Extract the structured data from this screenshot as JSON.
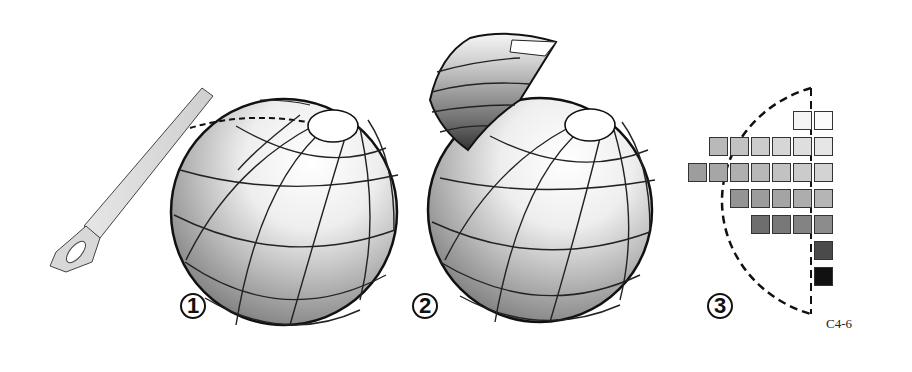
{
  "figure": {
    "caption_code": "C4-6",
    "panels": [
      {
        "number": "1",
        "label": "Sphere with saw cutting cap"
      },
      {
        "number": "2",
        "label": "Sphere with cut-away segment"
      },
      {
        "number": "3",
        "label": "Cross-section value grid"
      }
    ]
  },
  "grid": {
    "cells": [
      {
        "col": 5,
        "row": 0,
        "color": "#f4f4f4"
      },
      {
        "col": 6,
        "row": 0,
        "color": "#fbfbfb"
      },
      {
        "col": 1,
        "row": 1,
        "color": "#b9b9b9"
      },
      {
        "col": 2,
        "row": 1,
        "color": "#c2c2c2"
      },
      {
        "col": 3,
        "row": 1,
        "color": "#cccccc"
      },
      {
        "col": 4,
        "row": 1,
        "color": "#d6d6d6"
      },
      {
        "col": 5,
        "row": 1,
        "color": "#dedede"
      },
      {
        "col": 6,
        "row": 1,
        "color": "#e6e6e6"
      },
      {
        "col": 0,
        "row": 2,
        "color": "#9d9d9d"
      },
      {
        "col": 1,
        "row": 2,
        "color": "#a6a6a6"
      },
      {
        "col": 2,
        "row": 2,
        "color": "#afafaf"
      },
      {
        "col": 3,
        "row": 2,
        "color": "#b8b8b8"
      },
      {
        "col": 4,
        "row": 2,
        "color": "#c2c2c2"
      },
      {
        "col": 5,
        "row": 2,
        "color": "#cbcbcb"
      },
      {
        "col": 6,
        "row": 2,
        "color": "#d3d3d3"
      },
      {
        "col": 2,
        "row": 3,
        "color": "#949494"
      },
      {
        "col": 3,
        "row": 3,
        "color": "#9c9c9c"
      },
      {
        "col": 4,
        "row": 3,
        "color": "#a4a4a4"
      },
      {
        "col": 5,
        "row": 3,
        "color": "#adadad"
      },
      {
        "col": 6,
        "row": 3,
        "color": "#b5b5b5"
      },
      {
        "col": 3,
        "row": 4,
        "color": "#6e6e6e"
      },
      {
        "col": 4,
        "row": 4,
        "color": "#787878"
      },
      {
        "col": 5,
        "row": 4,
        "color": "#838383"
      },
      {
        "col": 6,
        "row": 4,
        "color": "#8c8c8c"
      },
      {
        "col": 6,
        "row": 5,
        "color": "#4a4a4a"
      },
      {
        "col": 6,
        "row": 6,
        "color": "#111111"
      }
    ]
  }
}
